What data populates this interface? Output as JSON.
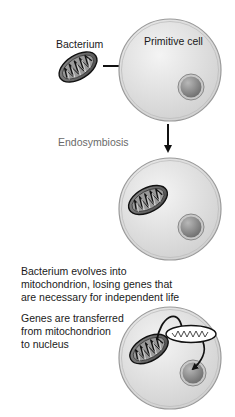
{
  "diagram": {
    "labels": {
      "bacterium": "Bacterium",
      "primitive_cell": "Primitive cell",
      "endosymbiosis": "Endosymbiosis"
    },
    "step3_text": [
      "Bacterium evolves into",
      "mitochondrion, losing genes that",
      "are necessary for independent life"
    ],
    "step4_text": [
      "Genes are transferred",
      "from mitochondrion",
      "to nucleus"
    ],
    "stages": [
      {
        "id": "free-bacterium-and-primitive-cell",
        "cell_center": [
          170,
          70
        ]
      },
      {
        "id": "after-endosymbiosis",
        "cell_center": [
          170,
          209
        ]
      },
      {
        "id": "gene-transfer",
        "cell_center": [
          170,
          358
        ]
      }
    ],
    "colors": {
      "cell_fill_light": "#f2f2f2",
      "cell_fill_dark": "#d2d2d2",
      "cell_border": "#9a9a9a",
      "nucleus_fill": "#8c8c8c",
      "mito_fill": "#7a7a7a",
      "stroke": "#111111",
      "gray_label": "#6a6a6a"
    }
  }
}
